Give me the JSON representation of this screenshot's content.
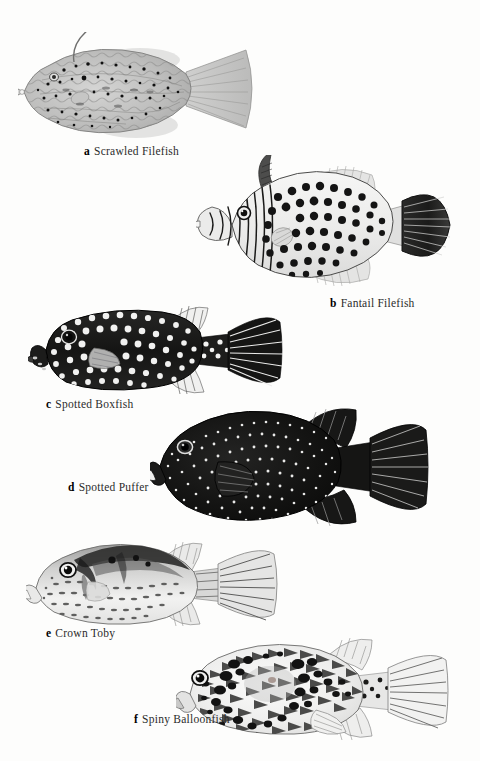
{
  "page": {
    "background_color": "#fdfdfc",
    "ink_color": "#1a1a1a"
  },
  "plate": {
    "figures": [
      {
        "letter": "a",
        "name": "Scrawled Filefish",
        "caption_x": 84,
        "caption_y": 145,
        "art_x": 18,
        "art_y": 32,
        "art_w": 242,
        "art_h": 112,
        "style": "light-mottled-wavy-lines",
        "body_fill": "#b9b9b9",
        "spot_color": "#111111"
      },
      {
        "letter": "b",
        "name": "Fantail Filefish",
        "caption_x": 330,
        "caption_y": 297,
        "art_x": 196,
        "art_y": 155,
        "art_w": 265,
        "art_h": 140,
        "style": "dark-round-spots-fantail",
        "body_fill": "#efefef",
        "spot_color": "#141414"
      },
      {
        "letter": "c",
        "name": "Spotted Boxfish",
        "caption_x": 46,
        "caption_y": 398,
        "art_x": 28,
        "art_y": 306,
        "art_w": 262,
        "art_h": 88,
        "style": "black-body-white-spots-box",
        "body_fill": "#181818",
        "spot_color": "#f2f2f2"
      },
      {
        "letter": "d",
        "name": "Spotted Puffer",
        "caption_x": 68,
        "caption_y": 481,
        "art_x": 150,
        "art_y": 404,
        "art_w": 282,
        "art_h": 130,
        "style": "black-body-fine-white-dots",
        "body_fill": "#131313",
        "spot_color": "#ededed"
      },
      {
        "letter": "e",
        "name": "Crown Toby",
        "caption_x": 46,
        "caption_y": 627,
        "art_x": 26,
        "art_y": 538,
        "art_w": 272,
        "art_h": 92,
        "style": "pale-body-dark-saddle-dashes",
        "body_fill": "#e8e8e8",
        "spot_color": "#3a3a3a"
      },
      {
        "letter": "f",
        "name": "Spiny Balloonfish",
        "caption_x": 134,
        "caption_y": 713,
        "art_x": 176,
        "art_y": 638,
        "art_w": 282,
        "art_h": 104,
        "style": "spiny-blotched-balloon",
        "body_fill": "#f0f0ef",
        "spot_color": "#121212"
      }
    ]
  }
}
